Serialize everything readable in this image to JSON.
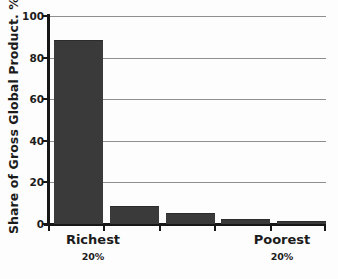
{
  "chart_data": {
    "type": "bar",
    "title": "",
    "subtitle": "",
    "xlabel": "",
    "ylabel": "Share of Gross Global Product. %",
    "categories": [
      "Richest 20%",
      "Second 20%",
      "Third 20%",
      "Fourth 20%",
      "Poorest 20%"
    ],
    "values": [
      88,
      8,
      5,
      2,
      1
    ],
    "ylim": [
      0,
      100
    ],
    "yticks": [
      0,
      20,
      40,
      60,
      80,
      100
    ],
    "ytick_labels": [
      "0",
      "20",
      "40",
      "60",
      "80",
      "100"
    ],
    "grid": true,
    "grid_axis": "y",
    "legend": false,
    "legend_position": "none",
    "bar_color": "#3a3a3a",
    "grid_color": "#8f8f8f",
    "axis_color": "#171717",
    "background_color": "#fdfdfd",
    "annotations": [
      {
        "id": "left-end",
        "main": "Richest",
        "sub": "20%"
      },
      {
        "id": "right-end",
        "main": "Poorest",
        "sub": "20%"
      }
    ]
  },
  "axis": {
    "y_title": "Share of Gross Global Product. %"
  },
  "x_axis_labels": {
    "left": {
      "main": "Richest",
      "sub": "20%"
    },
    "right": {
      "main": "Poorest",
      "sub": "20%"
    }
  }
}
